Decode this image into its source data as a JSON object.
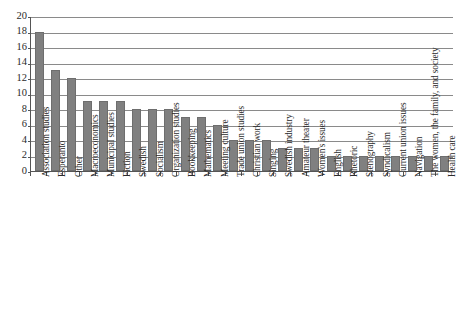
{
  "chart_data": {
    "type": "bar",
    "title": "",
    "subtitle": "",
    "xlabel": "",
    "ylabel": "",
    "ylim": [
      0,
      20
    ],
    "yticks": [
      0,
      2,
      4,
      6,
      8,
      10,
      12,
      14,
      16,
      18,
      20
    ],
    "grid": true,
    "legend": false,
    "legend_position": "none",
    "bar_color": "#808080",
    "bar_border_color": "#6e6e6e",
    "gridline_color": "#8a8a8a",
    "axis_color": "#555555",
    "background_color": "#ffffff",
    "categories": [
      "Association studies",
      "Esperanto",
      "Other",
      "Macroeconomics",
      "Municipal studies",
      "Fiction",
      "Swedish",
      "Socialism",
      "Organization studies",
      "Bookkeeping",
      "Mathematics",
      "Meeting culture",
      "Trade union studies",
      "Christian work",
      "Singing",
      "Swedish industry",
      "Amateur theater",
      "Women's issues",
      "English",
      "Rhetoric",
      "Stenography",
      "Syndicalism",
      "Current union issues",
      "Navigation",
      "The women, the family, and society",
      "Health care"
    ],
    "values": [
      18,
      13,
      12,
      9,
      9,
      9,
      8,
      8,
      8,
      7,
      7,
      6,
      4,
      4,
      4,
      3,
      3,
      3,
      2,
      2,
      2,
      2,
      2,
      2,
      2,
      2
    ]
  }
}
